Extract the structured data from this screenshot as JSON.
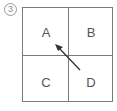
{
  "diagram": {
    "number_label": "3",
    "cells": [
      {
        "id": "A",
        "label": "A",
        "position": "top-left"
      },
      {
        "id": "B",
        "label": "B",
        "position": "top-right"
      },
      {
        "id": "C",
        "label": "C",
        "position": "bottom-left"
      },
      {
        "id": "D",
        "label": "D",
        "position": "bottom-right"
      }
    ],
    "arrow": {
      "from": "D",
      "to": "A",
      "color": "#333333"
    }
  }
}
